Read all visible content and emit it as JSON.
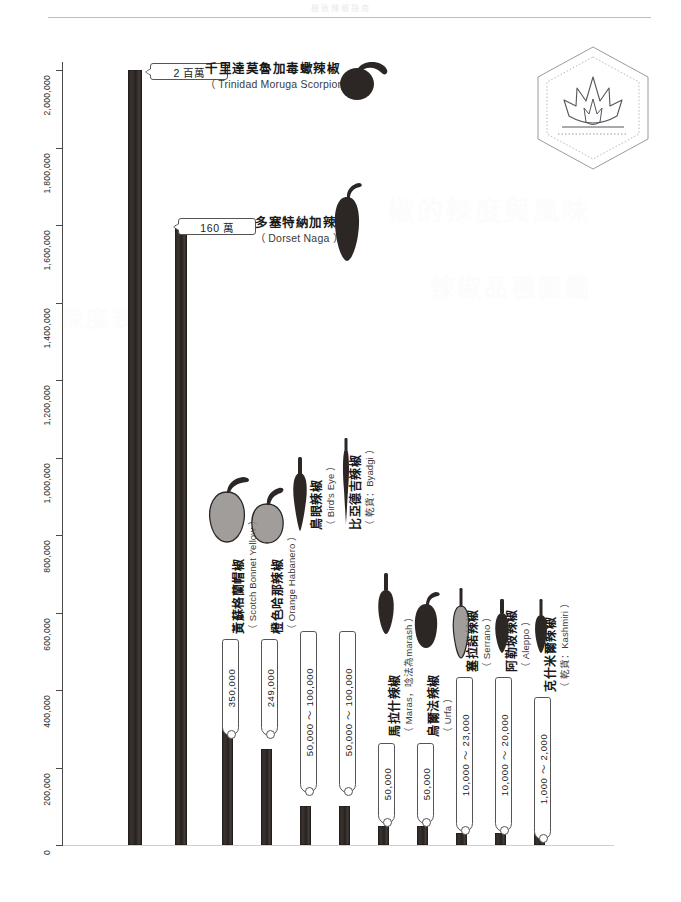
{
  "page": {
    "running_head": "極致辣椒指南",
    "ghost_text_1": "椒的辣度與風味",
    "ghost_text_2": "辣椒品種圖鑑",
    "ghost_text_3": "辣度表"
  },
  "badge": {
    "icon": "flame-hexagon-logo"
  },
  "chart_data": {
    "type": "bar",
    "xlabel": "",
    "ylabel": "Scoville Heat Units (SHU)",
    "ylim": [
      0,
      2000000
    ],
    "grid": false,
    "legend": "none",
    "ticks": [
      "0",
      "200,000",
      "400,000",
      "600,000",
      "800,000",
      "1,000,000",
      "1,200,000",
      "1,400,000",
      "1,600,000",
      "1,800,000",
      "2,000,000"
    ],
    "tick_values": [
      0,
      200000,
      400000,
      600000,
      800000,
      1000000,
      1200000,
      1400000,
      1600000,
      1800000,
      2000000
    ],
    "categories": [
      "千里達莫魯加毒蠍辣椒",
      "多塞特納加辣椒",
      "黃蘇格蘭帽椒",
      "橙色哈那辣椒",
      "鳥眼辣椒",
      "比亞德吉辣椒",
      "馬拉什辣椒",
      "烏爾法辣椒",
      "塞拉諾辣椒",
      "阿勒坡辣椒",
      "克什米爾辣椒"
    ],
    "values": [
      2000000,
      1600000,
      350000,
      249000,
      100000,
      100000,
      50000,
      50000,
      23000,
      20000,
      2000
    ],
    "bars": [
      {
        "zh": "千里達莫魯加毒蠍辣椒",
        "en": "（ Trinidad Moruga Scorpion ）",
        "value_label": "2 百萬",
        "value": 2000000,
        "value_min": 2000000,
        "value_max": 2000000,
        "pepper_icon": "trinidad-moruga-scorpion-pepper",
        "label_orientation": "horizontal"
      },
      {
        "zh": "多塞特納加辣椒",
        "en": "（ Dorset Naga ）",
        "value_label": "160 萬",
        "value": 1600000,
        "value_min": 1600000,
        "value_max": 1600000,
        "pepper_icon": "dorset-naga-pepper",
        "label_orientation": "horizontal"
      },
      {
        "zh": "黃蘇格蘭帽椒",
        "en": "（ Scotch Bonnet Yellow ）",
        "value_label": "350,000",
        "value": 350000,
        "value_min": 350000,
        "value_max": 350000,
        "pepper_icon": "scotch-bonnet-yellow-pepper",
        "label_orientation": "vertical"
      },
      {
        "zh": "橙色哈那辣椒",
        "en": "（ Orange Habanero ）",
        "value_label": "249,000",
        "value": 249000,
        "value_min": 249000,
        "value_max": 249000,
        "pepper_icon": "orange-habanero-pepper",
        "label_orientation": "vertical"
      },
      {
        "zh": "鳥眼辣椒",
        "en": "（ Bird's Eye ）",
        "value_label": "50,000 ～ 100,000",
        "value": 100000,
        "value_min": 50000,
        "value_max": 100000,
        "pepper_icon": "birds-eye-pepper",
        "label_orientation": "vertical"
      },
      {
        "zh": "比亞德吉辣椒",
        "en": "（ 乾貨：Byadgi ）",
        "value_label": "50,000 ～ 100,000",
        "value": 100000,
        "value_min": 50000,
        "value_max": 100000,
        "pepper_icon": "byadgi-pepper",
        "label_orientation": "vertical"
      },
      {
        "zh": "馬拉什辣椒",
        "en": "（ Maras，唸法為marash ）",
        "value_label": "50,000",
        "value": 50000,
        "value_min": 50000,
        "value_max": 50000,
        "pepper_icon": "maras-pepper",
        "label_orientation": "vertical"
      },
      {
        "zh": "烏爾法辣椒",
        "en": "（ Urfa ）",
        "value_label": "50,000",
        "value": 50000,
        "value_min": 50000,
        "value_max": 50000,
        "pepper_icon": "urfa-pepper",
        "label_orientation": "vertical"
      },
      {
        "zh": "塞拉諾辣椒",
        "en": "（ Serrano ）",
        "value_label": "10,000 ～ 23,000",
        "value": 23000,
        "value_min": 10000,
        "value_max": 23000,
        "pepper_icon": "serrano-pepper",
        "label_orientation": "vertical"
      },
      {
        "zh": "阿勒坡辣椒",
        "en": "（ Aleppo ）",
        "value_label": "10,000 ～ 20,000",
        "value": 20000,
        "value_min": 10000,
        "value_max": 20000,
        "pepper_icon": "aleppo-pepper",
        "label_orientation": "vertical"
      },
      {
        "zh": "克什米爾辣椒",
        "en": "（ 乾貨：Kashmiri ）",
        "value_label": "1,000 ～ 2,000",
        "value": 2000,
        "value_min": 1000,
        "value_max": 2000,
        "pepper_icon": "kashmiri-pepper",
        "label_orientation": "vertical"
      }
    ]
  },
  "colors": {
    "bar": "#2b2624",
    "axis": "#4a4a4a",
    "text": "#1a1a1a",
    "ghost": "#fcfcfd",
    "badge_outline": "#8d8d93"
  }
}
